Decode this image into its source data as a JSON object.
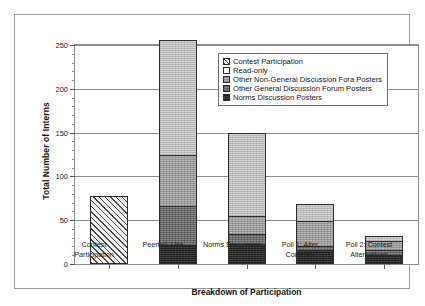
{
  "chart_data": {
    "type": "bar",
    "stacked": true,
    "title": "",
    "xlabel": "Breakdown of Participation",
    "ylabel": "Total Number of Interns",
    "ylim": [
      0,
      250
    ],
    "ytick_values": [
      0,
      50,
      100,
      150,
      200,
      250
    ],
    "ytick_labels": [
      "0",
      "50",
      "100",
      "150",
      "200",
      "250"
    ],
    "yminor_step": 10,
    "grid": true,
    "grid_axis": "y",
    "legend_position": "upper right inside plot",
    "categories": [
      "Contest Participation",
      "Peertalk Use",
      "Norms Discussion",
      "Poll 1: Alter Contest?",
      "Poll 2: Contest Alternatives"
    ],
    "category_lines": [
      [
        "Contest",
        "Participation"
      ],
      [
        "Peertalk Use",
        ""
      ],
      [
        "Norms Discussion",
        ""
      ],
      [
        "Poll 1: Alter",
        "Contest?"
      ],
      [
        "Poll 2: Contest",
        "Alternatives"
      ]
    ],
    "series": [
      {
        "name": "Contest Participation",
        "pattern": "diagonal-hatch",
        "color": "#f2f2f2",
        "values": [
          78,
          0,
          0,
          0,
          0
        ]
      },
      {
        "name": "Read-only",
        "pattern": "light-speckle",
        "color": "#d6d6d6",
        "values": [
          0,
          131,
          94,
          19,
          6
        ]
      },
      {
        "name": "Other Non-General Discussion Fora Posters",
        "pattern": "medium-light-speckle",
        "color": "#b7b7b7",
        "values": [
          0,
          59,
          21,
          29,
          10
        ]
      },
      {
        "name": "Other General Discussion Forum Posters",
        "pattern": "medium-dark-speckle",
        "color": "#8a8a8a",
        "values": [
          0,
          44,
          11,
          4,
          6
        ]
      },
      {
        "name": "Norms Discussion Posters",
        "pattern": "dark-solid",
        "color": "#3a3a3a",
        "values": [
          0,
          22,
          23,
          16,
          10
        ]
      }
    ],
    "stack_order_bottom_to_top": [
      "Norms Discussion Posters",
      "Other General Discussion Forum Posters",
      "Other Non-General Discussion Fora Posters",
      "Read-only"
    ],
    "totals": [
      78,
      256,
      149,
      68,
      32
    ]
  },
  "legend": {
    "items": [
      {
        "label": "Contest Participation",
        "swatch": "hatch"
      },
      {
        "label": "Read-only",
        "swatch": "white"
      },
      {
        "label": "Other Non-General Discussion Fora Posters",
        "swatch": "light-gray"
      },
      {
        "label": "Other General Discussion Forum Posters",
        "swatch": "medium-gray"
      },
      {
        "label": "Norms Discussion Posters",
        "swatch": "dark-gray"
      }
    ]
  },
  "axes": {
    "y_title": "Total Number of Interns",
    "x_title": "Breakdown of Participation",
    "y_ticks": [
      "250",
      "200",
      "150",
      "100",
      "50",
      "0"
    ]
  }
}
